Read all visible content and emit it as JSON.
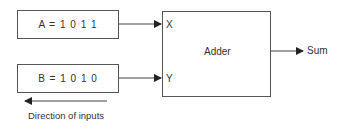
{
  "diagram": {
    "inputs": [
      {
        "id": "A",
        "label": "A = 1 0 1 1",
        "port": "X"
      },
      {
        "id": "B",
        "label": "B = 1 0 1 0",
        "port": "Y"
      }
    ],
    "block": {
      "label": "Adder",
      "ports_in": [
        "X",
        "Y"
      ]
    },
    "output": {
      "label": "Sum"
    },
    "direction_caption": "Direction of inputs"
  }
}
